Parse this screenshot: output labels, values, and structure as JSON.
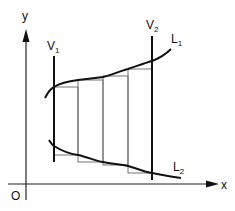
{
  "diagram": {
    "type": "area-between-curves-riemann-sum",
    "axes": {
      "x_label": "x",
      "y_label": "y",
      "origin_label": "O"
    },
    "lines": {
      "v1": {
        "label": "V",
        "subscript": "1"
      },
      "v2": {
        "label": "V",
        "subscript": "2"
      }
    },
    "curves": {
      "l1": {
        "label": "L",
        "subscript": "1"
      },
      "l2": {
        "label": "L",
        "subscript": "2"
      }
    },
    "rectangles_count": 4,
    "colors": {
      "stroke": "#111111",
      "thin_stroke": "#555555",
      "background": "#ffffff"
    }
  }
}
